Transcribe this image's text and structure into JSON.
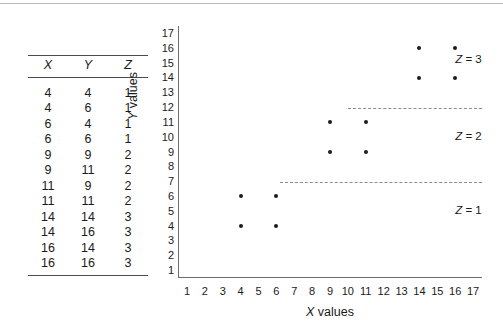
{
  "figure": {
    "table": {
      "columns": [
        "X",
        "Y",
        "Z"
      ],
      "rows": [
        [
          4,
          4,
          1
        ],
        [
          4,
          6,
          1
        ],
        [
          6,
          4,
          1
        ],
        [
          6,
          6,
          1
        ],
        [
          9,
          9,
          2
        ],
        [
          9,
          11,
          2
        ],
        [
          11,
          9,
          2
        ],
        [
          11,
          11,
          2
        ],
        [
          14,
          14,
          3
        ],
        [
          14,
          16,
          3
        ],
        [
          16,
          14,
          3
        ],
        [
          16,
          16,
          3
        ]
      ]
    },
    "zone_labels": [
      {
        "text": "Z = 3",
        "var": "Z",
        "eq": "= 3",
        "value": 3
      },
      {
        "text": "Z = 2",
        "var": "Z",
        "eq": "= 2",
        "value": 2
      },
      {
        "text": "Z = 1",
        "var": "Z",
        "eq": "= 1",
        "value": 1
      }
    ]
  },
  "chart_data": {
    "type": "scatter",
    "title": "",
    "xlabel": "X values",
    "ylabel": "Y values",
    "xlabel_italic_part": "X",
    "xlabel_rest": " values",
    "ylabel_italic_part": "Y",
    "ylabel_rest": " values",
    "xlim": [
      0.5,
      17.5
    ],
    "ylim": [
      0.5,
      17.5
    ],
    "xticks": [
      1,
      2,
      3,
      4,
      5,
      6,
      7,
      8,
      9,
      10,
      11,
      12,
      13,
      14,
      15,
      16,
      17
    ],
    "yticks": [
      1,
      2,
      3,
      4,
      5,
      6,
      7,
      8,
      9,
      10,
      11,
      12,
      13,
      14,
      15,
      16,
      17
    ],
    "grid": false,
    "legend": "none",
    "marker_color": "#1c1c1c",
    "divider_color": "#8c8c8c",
    "axis_color": "#6d6d6d",
    "points": [
      {
        "x": 4,
        "y": 4,
        "z": 1
      },
      {
        "x": 4,
        "y": 6,
        "z": 1
      },
      {
        "x": 6,
        "y": 4,
        "z": 1
      },
      {
        "x": 6,
        "y": 6,
        "z": 1
      },
      {
        "x": 9,
        "y": 9,
        "z": 2
      },
      {
        "x": 9,
        "y": 11,
        "z": 2
      },
      {
        "x": 11,
        "y": 9,
        "z": 2
      },
      {
        "x": 11,
        "y": 11,
        "z": 2
      },
      {
        "x": 14,
        "y": 14,
        "z": 3
      },
      {
        "x": 14,
        "y": 16,
        "z": 3
      },
      {
        "x": 16,
        "y": 14,
        "z": 3
      },
      {
        "x": 16,
        "y": 16,
        "z": 3
      }
    ],
    "dividers": [
      {
        "y": 12,
        "x_start": 10,
        "x_end": 17.6,
        "style": "dashed",
        "separates": "Z=2 from Z=3"
      },
      {
        "y": 7,
        "x_start": 6.2,
        "x_end": 17.6,
        "style": "dashed",
        "separates": "Z=1 from Z=2"
      }
    ],
    "annotations": [
      {
        "text": "Z = 3",
        "x": 16.0,
        "y": 15.2
      },
      {
        "text": "Z = 2",
        "x": 16.0,
        "y": 10.0
      },
      {
        "text": "Z = 1",
        "x": 16.0,
        "y": 5.0
      }
    ]
  }
}
